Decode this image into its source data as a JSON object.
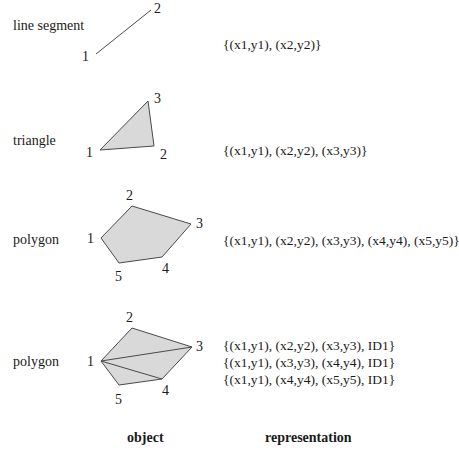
{
  "rows": [
    {
      "label": "line segment",
      "type": "line",
      "vertices": [
        [
          96,
          54
        ],
        [
          151,
          10
        ]
      ],
      "vertex_labels": [
        "1",
        "2"
      ],
      "representation": [
        "{(x1,y1), (x2,y2)}"
      ]
    },
    {
      "label": "triangle",
      "type": "triangle",
      "vertices": [
        [
          100,
          150
        ],
        [
          154,
          146
        ],
        [
          148,
          101
        ]
      ],
      "vertex_labels": [
        "1",
        "2",
        "3"
      ],
      "representation": [
        "{(x1,y1), (x2,y2), (x3,y3)}"
      ]
    },
    {
      "label": "polygon",
      "type": "polygon",
      "vertices": [
        [
          101,
          238
        ],
        [
          132,
          206
        ],
        [
          191,
          224
        ],
        [
          162,
          257
        ],
        [
          119,
          263
        ]
      ],
      "vertex_labels": [
        "1",
        "2",
        "3",
        "4",
        "5"
      ],
      "representation": [
        "{(x1,y1), (x2,y2), (x3,y3), (x4,y4), (x5,y5)}"
      ]
    },
    {
      "label": "polygon",
      "type": "triangulated-polygon",
      "vertices": [
        [
          101,
          361
        ],
        [
          132,
          328
        ],
        [
          192,
          347
        ],
        [
          162,
          379
        ],
        [
          119,
          385
        ]
      ],
      "vertex_labels": [
        "1",
        "2",
        "3",
        "4",
        "5"
      ],
      "representation": [
        "{(x1,y1), (x2,y2), (x3,y3), ID1}",
        "{(x1,y1), (x3,y3), (x4,y4), ID1}",
        "{(x1,y1), (x4,y4), (x5,y5), ID1}"
      ]
    }
  ],
  "footer": {
    "object_label": "object",
    "representation_label": "representation"
  },
  "colors": {
    "fill": "#d9d9d9",
    "stroke": "#4a4a4a",
    "text": "#1a1a1a"
  }
}
